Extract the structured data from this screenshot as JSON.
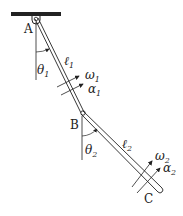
{
  "diagram": {
    "type": "double-pendulum",
    "points": {
      "A": {
        "label": "A"
      },
      "B": {
        "label": "B"
      },
      "C": {
        "label": "C"
      }
    },
    "link1": {
      "length": "ℓ",
      "length_sub": "1",
      "angle": "θ",
      "angle_sub": "1",
      "omega": "ω",
      "omega_sub": "1",
      "alpha": "α",
      "alpha_sub": "1"
    },
    "link2": {
      "length": "ℓ",
      "length_sub": "2",
      "angle": "θ",
      "angle_sub": "2",
      "omega": "ω",
      "omega_sub": "2",
      "alpha": "α",
      "alpha_sub": "2"
    },
    "colors": {
      "stroke": "#222222",
      "ceiling": "#222222",
      "background": "#ffffff"
    }
  }
}
